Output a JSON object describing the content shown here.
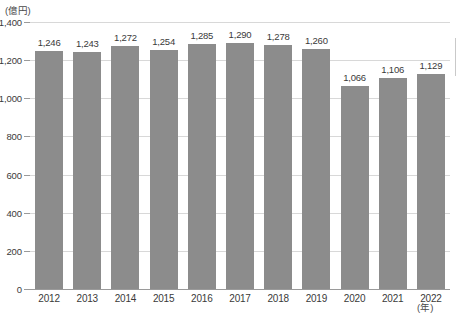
{
  "chart_data": {
    "type": "bar",
    "title": "",
    "subtitle": "",
    "xlabel": "(年)",
    "ylabel": "(億円)",
    "categories": [
      "2012",
      "2013",
      "2014",
      "2015",
      "2016",
      "2017",
      "2018",
      "2019",
      "2020",
      "2021",
      "2022"
    ],
    "values": [
      1246,
      1243,
      1272,
      1254,
      1285,
      1290,
      1278,
      1260,
      1066,
      1106,
      1129
    ],
    "value_labels": [
      "1,246",
      "1,243",
      "1,272",
      "1,254",
      "1,285",
      "1,290",
      "1,278",
      "1,260",
      "1,066",
      "1,106",
      "1,129"
    ],
    "ylim": [
      0,
      1400
    ],
    "yticks": [
      0,
      200,
      400,
      600,
      800,
      1000,
      1200,
      1400
    ],
    "ytick_labels": [
      "0",
      "200",
      "400",
      "600",
      "800",
      "1,000",
      "1,200",
      "1,400"
    ],
    "grid": true,
    "legend": "none",
    "bar_color": "#8c8c8c",
    "grid_color": "#d8d8d8",
    "axis_color": "#9a9a9a",
    "text_color": "#3a3a3a",
    "background": "#ffffff"
  }
}
